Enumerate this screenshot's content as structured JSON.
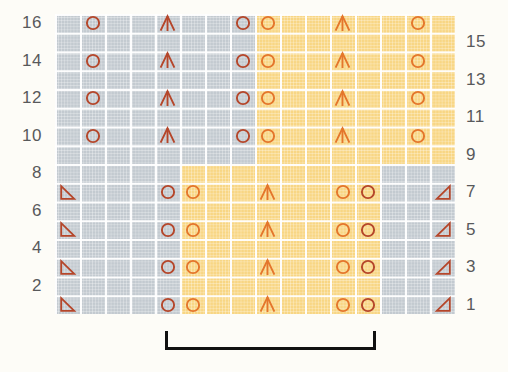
{
  "chart_data": {
    "type": "table",
    "title": "",
    "grid": {
      "columns": 16,
      "rows": 16
    },
    "row_labels_left": [
      "16",
      "14",
      "12",
      "10",
      "8",
      "6",
      "4",
      "2"
    ],
    "row_labels_right": [
      "15",
      "13",
      "11",
      "9",
      "7",
      "5",
      "3",
      "1"
    ],
    "colors": {
      "gray": "#c3cad0",
      "yellow": "#f8d684",
      "symbol_red": "#b5462a",
      "symbol_orange": "#e4762c",
      "label": "#58595b",
      "bracket": "#111111",
      "background": "#fdfcf7"
    },
    "color_blocks": [
      {
        "name": "upper-left-gray",
        "color": "gray",
        "col_start": 1,
        "col_end": 8,
        "row_start": 9,
        "row_end": 16
      },
      {
        "name": "upper-right-yellow",
        "color": "yellow",
        "col_start": 9,
        "col_end": 16,
        "row_start": 9,
        "row_end": 16
      },
      {
        "name": "lower-left-gray",
        "color": "gray",
        "col_start": 1,
        "col_end": 5,
        "row_start": 1,
        "row_end": 8
      },
      {
        "name": "lower-mid-yellow",
        "color": "yellow",
        "col_start": 6,
        "col_end": 13,
        "row_start": 1,
        "row_end": 8
      },
      {
        "name": "lower-right-gray",
        "color": "gray",
        "col_start": 14,
        "col_end": 16,
        "row_start": 1,
        "row_end": 8
      }
    ],
    "symbol_legend": [
      {
        "key": "circle",
        "name": "yarn-over",
        "glyph": "O"
      },
      {
        "key": "arrow",
        "name": "centered-double-decrease",
        "glyph": "A"
      },
      {
        "key": "tri_left",
        "name": "decrease-left",
        "glyph": "left-triangle"
      },
      {
        "key": "tri_right",
        "name": "decrease-right",
        "glyph": "right-triangle"
      }
    ],
    "symbols": [
      {
        "row": 16,
        "col": 2,
        "type": "circle",
        "color": "symbol_red"
      },
      {
        "row": 16,
        "col": 5,
        "type": "arrow",
        "color": "symbol_red"
      },
      {
        "row": 16,
        "col": 8,
        "type": "circle",
        "color": "symbol_red"
      },
      {
        "row": 16,
        "col": 9,
        "type": "circle",
        "color": "symbol_orange"
      },
      {
        "row": 16,
        "col": 12,
        "type": "arrow",
        "color": "symbol_orange"
      },
      {
        "row": 16,
        "col": 15,
        "type": "circle",
        "color": "symbol_orange"
      },
      {
        "row": 14,
        "col": 2,
        "type": "circle",
        "color": "symbol_red"
      },
      {
        "row": 14,
        "col": 5,
        "type": "arrow",
        "color": "symbol_red"
      },
      {
        "row": 14,
        "col": 8,
        "type": "circle",
        "color": "symbol_red"
      },
      {
        "row": 14,
        "col": 9,
        "type": "circle",
        "color": "symbol_orange"
      },
      {
        "row": 14,
        "col": 12,
        "type": "arrow",
        "color": "symbol_orange"
      },
      {
        "row": 14,
        "col": 15,
        "type": "circle",
        "color": "symbol_orange"
      },
      {
        "row": 12,
        "col": 2,
        "type": "circle",
        "color": "symbol_red"
      },
      {
        "row": 12,
        "col": 5,
        "type": "arrow",
        "color": "symbol_red"
      },
      {
        "row": 12,
        "col": 8,
        "type": "circle",
        "color": "symbol_red"
      },
      {
        "row": 12,
        "col": 9,
        "type": "circle",
        "color": "symbol_orange"
      },
      {
        "row": 12,
        "col": 12,
        "type": "arrow",
        "color": "symbol_orange"
      },
      {
        "row": 12,
        "col": 15,
        "type": "circle",
        "color": "symbol_orange"
      },
      {
        "row": 10,
        "col": 2,
        "type": "circle",
        "color": "symbol_red"
      },
      {
        "row": 10,
        "col": 5,
        "type": "arrow",
        "color": "symbol_red"
      },
      {
        "row": 10,
        "col": 8,
        "type": "circle",
        "color": "symbol_red"
      },
      {
        "row": 10,
        "col": 9,
        "type": "circle",
        "color": "symbol_orange"
      },
      {
        "row": 10,
        "col": 12,
        "type": "arrow",
        "color": "symbol_orange"
      },
      {
        "row": 10,
        "col": 15,
        "type": "circle",
        "color": "symbol_orange"
      },
      {
        "row": 7,
        "col": 1,
        "type": "tri_left",
        "color": "symbol_red"
      },
      {
        "row": 7,
        "col": 5,
        "type": "circle",
        "color": "symbol_red"
      },
      {
        "row": 7,
        "col": 6,
        "type": "circle",
        "color": "symbol_orange"
      },
      {
        "row": 7,
        "col": 9,
        "type": "arrow",
        "color": "symbol_orange"
      },
      {
        "row": 7,
        "col": 12,
        "type": "circle",
        "color": "symbol_orange"
      },
      {
        "row": 7,
        "col": 13,
        "type": "circle",
        "color": "symbol_red"
      },
      {
        "row": 7,
        "col": 16,
        "type": "tri_right",
        "color": "symbol_red"
      },
      {
        "row": 5,
        "col": 1,
        "type": "tri_left",
        "color": "symbol_red"
      },
      {
        "row": 5,
        "col": 5,
        "type": "circle",
        "color": "symbol_red"
      },
      {
        "row": 5,
        "col": 6,
        "type": "circle",
        "color": "symbol_orange"
      },
      {
        "row": 5,
        "col": 9,
        "type": "arrow",
        "color": "symbol_orange"
      },
      {
        "row": 5,
        "col": 12,
        "type": "circle",
        "color": "symbol_orange"
      },
      {
        "row": 5,
        "col": 13,
        "type": "circle",
        "color": "symbol_red"
      },
      {
        "row": 5,
        "col": 16,
        "type": "tri_right",
        "color": "symbol_red"
      },
      {
        "row": 3,
        "col": 1,
        "type": "tri_left",
        "color": "symbol_red"
      },
      {
        "row": 3,
        "col": 5,
        "type": "circle",
        "color": "symbol_red"
      },
      {
        "row": 3,
        "col": 6,
        "type": "circle",
        "color": "symbol_orange"
      },
      {
        "row": 3,
        "col": 9,
        "type": "arrow",
        "color": "symbol_orange"
      },
      {
        "row": 3,
        "col": 12,
        "type": "circle",
        "color": "symbol_orange"
      },
      {
        "row": 3,
        "col": 13,
        "type": "circle",
        "color": "symbol_red"
      },
      {
        "row": 3,
        "col": 16,
        "type": "tri_right",
        "color": "symbol_red"
      },
      {
        "row": 1,
        "col": 1,
        "type": "tri_left",
        "color": "symbol_red"
      },
      {
        "row": 1,
        "col": 5,
        "type": "circle",
        "color": "symbol_red"
      },
      {
        "row": 1,
        "col": 6,
        "type": "circle",
        "color": "symbol_orange"
      },
      {
        "row": 1,
        "col": 9,
        "type": "arrow",
        "color": "symbol_orange"
      },
      {
        "row": 1,
        "col": 12,
        "type": "circle",
        "color": "symbol_orange"
      },
      {
        "row": 1,
        "col": 13,
        "type": "circle",
        "color": "symbol_red"
      },
      {
        "row": 1,
        "col": 16,
        "type": "tri_right",
        "color": "symbol_red"
      }
    ],
    "repeat_bracket": {
      "name": "pattern-repeat",
      "col_start": 5,
      "col_end": 13
    }
  }
}
